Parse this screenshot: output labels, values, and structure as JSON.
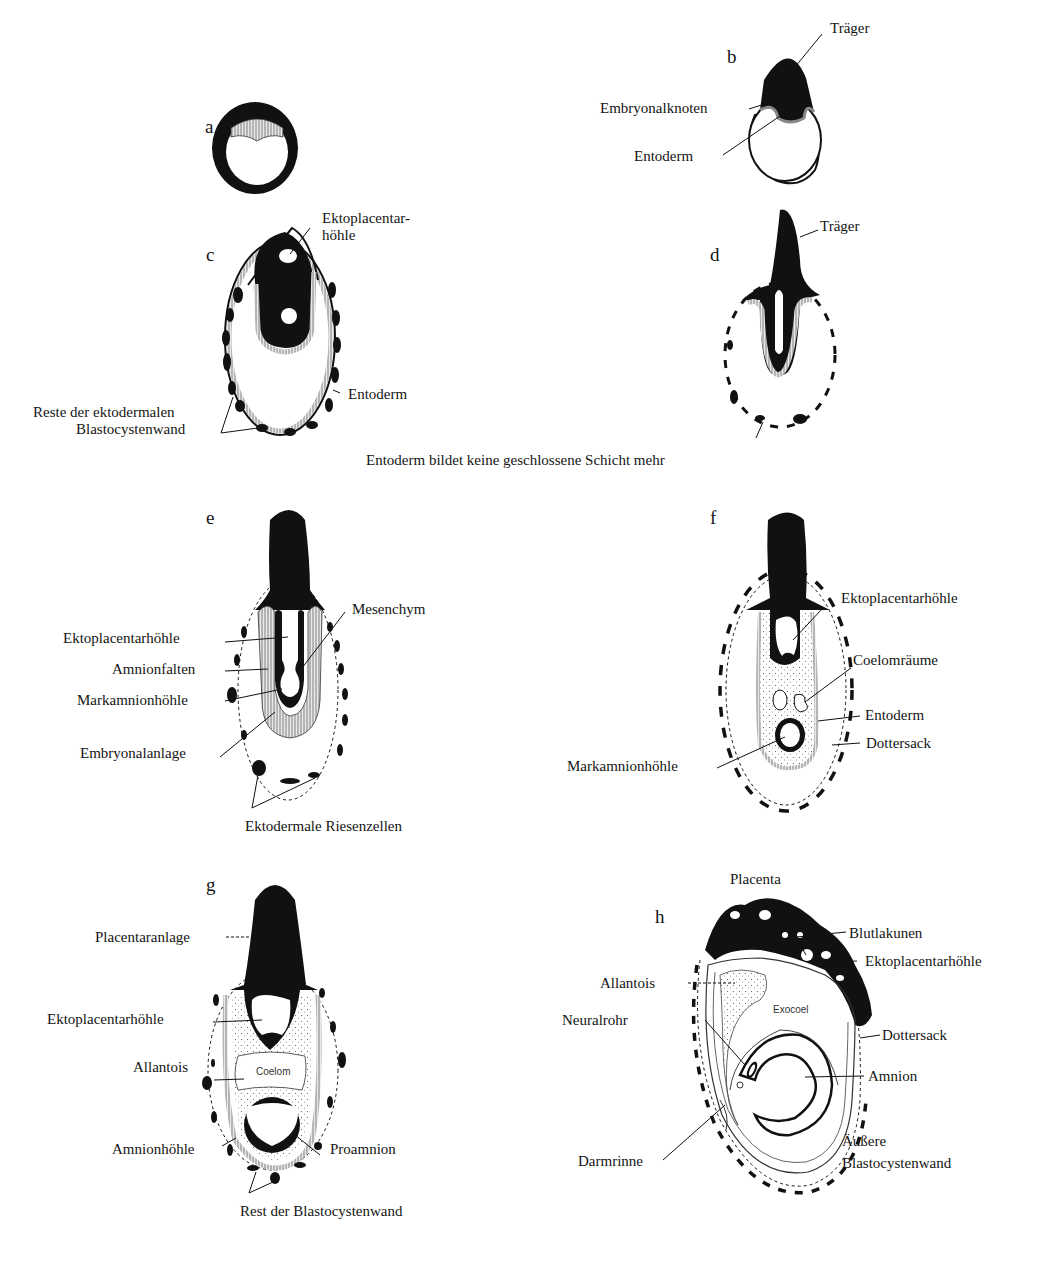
{
  "figures": {
    "a": {
      "letter": "a"
    },
    "b": {
      "letter": "b",
      "labels": {
        "traeger": "Träger",
        "embryonalknoten": "Embryonalknoten",
        "entoderm": "Entoderm"
      }
    },
    "c": {
      "letter": "c",
      "labels": {
        "ektoplacentar_1": "Ektoplacentar-",
        "ektoplacentar_2": "höhle",
        "entoderm": "Entoderm",
        "reste_1": "Reste der ektodermalen",
        "reste_2": "Blastocystenwand"
      }
    },
    "d": {
      "letter": "d",
      "labels": {
        "traeger": "Träger"
      }
    },
    "cd_caption": "Entoderm bildet keine geschlossene Schicht mehr",
    "e": {
      "letter": "e",
      "labels": {
        "mesenchym": "Mesenchym",
        "ektoplacentarhoehle": "Ektoplacentarhöhle",
        "amnionfalten": "Amnionfalten",
        "markamnionhoehle": "Markamnionhöhle",
        "embryonalanlage": "Embryonalanlage",
        "riesenzellen": "Ektodermale Riesenzellen"
      }
    },
    "f": {
      "letter": "f",
      "labels": {
        "ektoplacentarhoehle": "Ektoplacentarhöhle",
        "coelomraeume": "Coelomräume",
        "entoderm": "Entoderm",
        "dottersack": "Dottersack",
        "markamnionhoehle": "Markamnionhöhle"
      }
    },
    "g": {
      "letter": "g",
      "labels": {
        "placentaranlage": "Placentaranlage",
        "ektoplacentarhoehle": "Ektoplacentarhöhle",
        "allantois": "Allantois",
        "coelom": "Coelom",
        "amnionhoehle": "Amnionhöhle",
        "proamnion": "Proamnion",
        "rest": "Rest der Blastocystenwand"
      }
    },
    "h": {
      "letter": "h",
      "labels": {
        "placenta": "Placenta",
        "blutlakunen": "Blutlakunen",
        "ektoplacentarhoehle": "Ektoplacentarhöhle",
        "allantois": "Allantois",
        "exocoel": "Exocoel",
        "neuralrohr": "Neuralrohr",
        "dottersack": "Dottersack",
        "amnion": "Amnion",
        "darmrinne": "Darmrinne",
        "aeussere_1": "Äußere",
        "aeussere_2": "Blastocystenwand"
      }
    }
  },
  "colors": {
    "ink": "#111111",
    "hatch": "#9a9a9a",
    "paper": "#ffffff"
  }
}
